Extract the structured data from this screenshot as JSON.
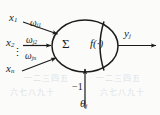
{
  "figure": {
    "name": "artificial-neuron-model",
    "background_color": "#fbfbfa",
    "stroke_color": "#1b1b1b"
  },
  "inputs": [
    {
      "variable": "x",
      "index": "1",
      "weight_symbol": "ω",
      "weight_sub": "j1"
    },
    {
      "variable": "x",
      "index": "2",
      "weight_symbol": "ω",
      "weight_sub": "j2"
    },
    {
      "variable": "x",
      "index": "n",
      "weight_symbol": "ω",
      "weight_sub": "jn"
    }
  ],
  "labels": {
    "x1": "x",
    "x1_sub": "1",
    "x2": "x",
    "x2_sub": "2",
    "xn": "x",
    "xn_sub": "n",
    "w1": "ω",
    "w1_sub": "j1",
    "w2": "ω",
    "w2_sub": "j2",
    "wn": "ω",
    "wn_sub": "jn",
    "vdots": "⋮",
    "summation": "Σ",
    "activation": "f(·)",
    "output": "y",
    "output_sub": "j",
    "bias_input": "−1",
    "threshold": "θ",
    "threshold_sub": "j"
  },
  "ghost_text": {
    "line1": "一二三四五",
    "line2": "六七八九十",
    "line3": "一二三四五",
    "line4": "六七八九十"
  },
  "geometry": {
    "body_shape": "ellipse",
    "body_center_x": 85,
    "body_center_y": 46,
    "body_radius_x": 33,
    "body_radius_y": 26,
    "divider": "vertical-arc",
    "arrow_count_in": 4,
    "arrow_count_out": 1
  }
}
